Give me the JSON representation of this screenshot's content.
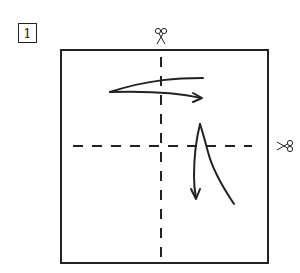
{
  "step": {
    "number": "1"
  },
  "diagram": {
    "stroke_color": "#222222",
    "background_color": "#ffffff",
    "square": {
      "x": 61,
      "y": 50,
      "width": 207,
      "height": 213
    },
    "fold_lines": [
      {
        "orientation": "vertical",
        "x": 161,
        "y1": 57,
        "y2": 258,
        "style": "dashed"
      },
      {
        "orientation": "horizontal",
        "y": 146,
        "x1": 73,
        "x2": 252,
        "style": "dashed"
      }
    ],
    "cut_marks": [
      {
        "icon": "scissors-icon",
        "position": "top",
        "x": 161,
        "y": 37
      },
      {
        "icon": "scissors-icon",
        "position": "right",
        "x": 284,
        "y": 146
      }
    ],
    "arrows": [
      {
        "name": "fold-right-arrow",
        "direction": "right",
        "description": "Fold top half from left to right"
      },
      {
        "name": "fold-down-arrow",
        "direction": "down",
        "description": "Fold right portion downward"
      }
    ]
  }
}
